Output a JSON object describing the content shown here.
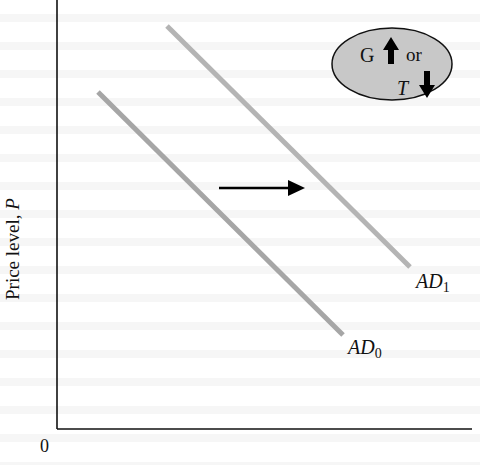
{
  "diagram": {
    "type": "aggregate-demand-shift",
    "y_axis": {
      "label_text": "Price level, ",
      "label_var": "P"
    },
    "x_axis": {
      "origin_label": "0"
    },
    "curves": [
      {
        "name": "AD",
        "subscript": "0",
        "color": "#a6a6a6",
        "x1": 98,
        "y1": 92,
        "x2": 343,
        "y2": 335
      },
      {
        "name": "AD",
        "subscript": "1",
        "color": "#b4b4b4",
        "x1": 167,
        "y1": 26,
        "x2": 410,
        "y2": 267
      }
    ],
    "shift_arrow": {
      "direction": "right",
      "color": "#000000"
    },
    "bubble": {
      "fill": "#c8c8c8",
      "g_label": "G",
      "g_direction": "up",
      "connector": "or",
      "t_label": "T",
      "t_direction": "down"
    }
  }
}
